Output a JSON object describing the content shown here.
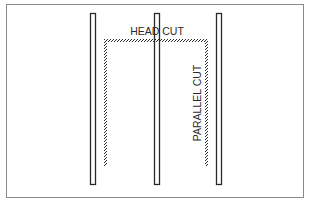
{
  "diagram": {
    "labels": {
      "head_cut": "HEAD CUT",
      "parallel_cut": "PARALLEL CUT"
    },
    "bars": [
      {
        "name": "left-bar",
        "x": 90,
        "y": 13,
        "width": 6,
        "height": 172
      },
      {
        "name": "middle-bar",
        "x": 154,
        "y": 13,
        "width": 6,
        "height": 172
      },
      {
        "name": "right-bar",
        "x": 216,
        "y": 13,
        "width": 6,
        "height": 172
      }
    ],
    "cut_path": {
      "left_x": 105,
      "right_x": 207,
      "top_y": 40,
      "bottom_y": 166
    },
    "colors": {
      "stroke": "#2a2a2a",
      "frame": "#8a8a8a",
      "background": "#ffffff"
    }
  }
}
